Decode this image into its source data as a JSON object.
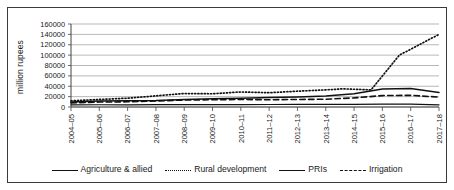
{
  "figure": {
    "background": "#ffffff",
    "frame_color": "#3a3a3a"
  },
  "chart_data": {
    "type": "line",
    "title": "",
    "xlabel": "",
    "ylabel": "million rupees",
    "ylim": [
      0,
      160000
    ],
    "ytick_step": 20000,
    "yticks": [
      0,
      20000,
      40000,
      60000,
      80000,
      100000,
      120000,
      140000,
      160000
    ],
    "ytick_labels": [
      "0",
      "20000",
      "40000",
      "60000",
      "80000",
      "100000",
      "120000",
      "140000",
      "160000"
    ],
    "grid": true,
    "grid_color": "#9a9a9a",
    "legend_position": "bottom",
    "categories": [
      "2004–05",
      "2005–06",
      "2006–07",
      "2007–08",
      "2008–09",
      "2009–10",
      "2010–11",
      "2011–12",
      "2012–13",
      "2013–14",
      "2014–15",
      "2015–16",
      "2016–17",
      "2017–18"
    ],
    "series": [
      {
        "name": "Agriculture & allied",
        "style": "solid",
        "color": "#111111",
        "width": 1.5,
        "values": [
          9500,
          11500,
          12000,
          12500,
          14500,
          16000,
          17000,
          18500,
          19500,
          21000,
          25500,
          34500,
          35500,
          28000
        ]
      },
      {
        "name": "Rural development",
        "style": "dotted",
        "color": "#111111",
        "width": 1.7,
        "values": [
          12000,
          14500,
          17000,
          21500,
          26000,
          25500,
          29000,
          27500,
          30500,
          33000,
          35000,
          33000,
          100000,
          140000
        ]
      },
      {
        "name": "PRIs",
        "style": "solid",
        "color": "#111111",
        "width": 1.2,
        "values": [
          4200,
          4300,
          4200,
          4400,
          4500,
          4600,
          4700,
          4800,
          4900,
          5000,
          5200,
          5400,
          5600,
          4000
        ]
      },
      {
        "name": "Irrigation",
        "style": "dashed",
        "color": "#111111",
        "width": 1.6,
        "values": [
          8000,
          9500,
          10000,
          11500,
          13500,
          14000,
          14500,
          14000,
          14500,
          15000,
          17500,
          22000,
          22500,
          19000
        ]
      }
    ],
    "rural_development_xpoints": [
      0,
      1,
      2,
      3,
      4,
      5,
      6,
      7,
      8,
      9,
      9.6,
      10.6,
      11.6,
      13
    ]
  },
  "legend": {
    "items": [
      {
        "label": "Agriculture & allied",
        "style": "solid"
      },
      {
        "label": "Rural development",
        "style": "dotted"
      },
      {
        "label": "PRIs",
        "style": "thin"
      },
      {
        "label": "Irrigation",
        "style": "dashed"
      }
    ]
  }
}
